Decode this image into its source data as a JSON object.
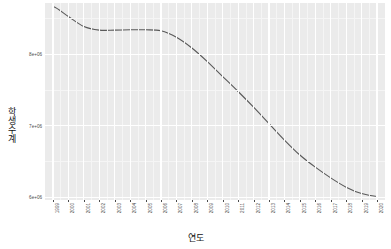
{
  "chart_data": {
    "type": "line",
    "title": "",
    "subtitle": "",
    "xlabel": "연도",
    "ylabel": "학생수계",
    "grid": true,
    "legend": false,
    "legend_position": "none",
    "line_color": "#595959",
    "panel_color": "#ebebeb",
    "gridline_color": "#ffffff",
    "x": [
      1999,
      2000,
      2001,
      2002,
      2003,
      2004,
      2005,
      2006,
      2007,
      2008,
      2009,
      2010,
      2011,
      2012,
      2013,
      2014,
      2015,
      2016,
      2017,
      2018,
      2019,
      2020
    ],
    "x_tick_labels": [
      "1999",
      "2000",
      "2001",
      "2002",
      "2003",
      "2004",
      "2005",
      "2006",
      "2007",
      "2008",
      "2009",
      "2010",
      "2011",
      "2012",
      "2013",
      "2014",
      "2015",
      "2016",
      "2017",
      "2018",
      "2019",
      "2020"
    ],
    "y_tick_labels": [
      "8e+06",
      "7e+06",
      "6e+06"
    ],
    "y_tick_values": [
      8000000,
      7000000,
      6000000
    ],
    "ylim": [
      5960000,
      8720000
    ],
    "xlim": [
      1999,
      2020
    ],
    "series": [
      {
        "name": "학생수계",
        "values": [
          8670000,
          8530000,
          8390000,
          8340000,
          8340000,
          8345000,
          8345000,
          8330000,
          8240000,
          8090000,
          7900000,
          7690000,
          7480000,
          7260000,
          7030000,
          6800000,
          6590000,
          6420000,
          6270000,
          6140000,
          6050000,
          6010000
        ]
      }
    ]
  }
}
